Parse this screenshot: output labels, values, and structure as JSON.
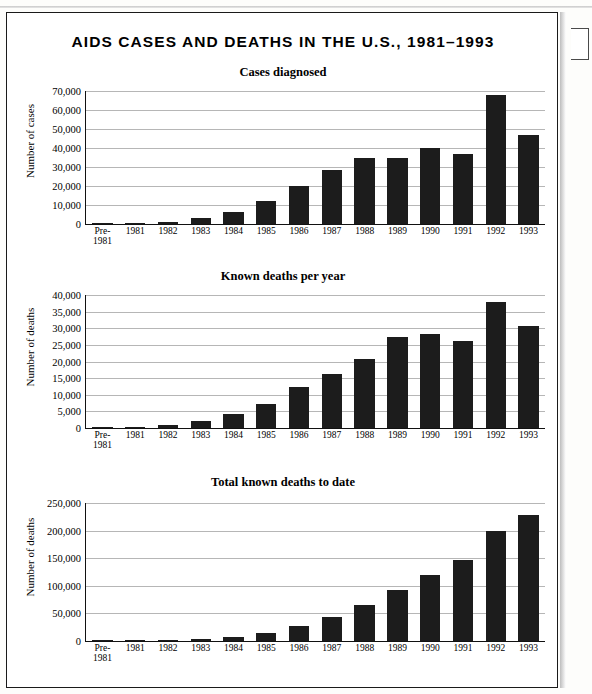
{
  "figure": {
    "main_title": "AIDS CASES AND DEATHS IN THE U.S., 1981–1993"
  },
  "chart_data": [
    {
      "type": "bar",
      "title": "Cases diagnosed",
      "xlabel": "",
      "ylabel": "Number of cases",
      "ylim": [
        0,
        70000
      ],
      "ytick_labels": [
        "0",
        "10,000",
        "20,000",
        "30,000",
        "40,000",
        "50,000",
        "60,000",
        "70,000"
      ],
      "yticks": [
        0,
        10000,
        20000,
        30000,
        40000,
        50000,
        60000,
        70000
      ],
      "grid": true,
      "legend": "none",
      "categories": [
        "Pre-\n1981",
        "1981",
        "1982",
        "1983",
        "1984",
        "1985",
        "1986",
        "1987",
        "1988",
        "1989",
        "1990",
        "1991",
        "1992",
        "1993"
      ],
      "values": [
        100,
        350,
        1300,
        3200,
        6400,
        12000,
        20000,
        28500,
        35000,
        34500,
        40000,
        37000,
        68000,
        47000
      ]
    },
    {
      "type": "bar",
      "title": "Known deaths per year",
      "xlabel": "",
      "ylabel": "Number of deaths",
      "ylim": [
        0,
        40000
      ],
      "ytick_labels": [
        "0",
        "5,000",
        "10,000",
        "15,000",
        "20,000",
        "25,000",
        "30,000",
        "35,000",
        "40,000"
      ],
      "yticks": [
        0,
        5000,
        10000,
        15000,
        20000,
        25000,
        30000,
        35000,
        40000
      ],
      "grid": true,
      "legend": "none",
      "categories": [
        "Pre-\n1981",
        "1981",
        "1982",
        "1983",
        "1984",
        "1985",
        "1986",
        "1987",
        "1988",
        "1989",
        "1990",
        "1991",
        "1992",
        "1993"
      ],
      "values": [
        60,
        250,
        900,
        2200,
        4300,
        7300,
        12200,
        16300,
        20800,
        27300,
        28200,
        26300,
        38000,
        30800
      ]
    },
    {
      "type": "bar",
      "title": "Total known deaths to date",
      "xlabel": "",
      "ylabel": "Number of deaths",
      "ylim": [
        0,
        250000
      ],
      "ytick_labels": [
        "0",
        "50,000",
        "100,000",
        "150,000",
        "200,000",
        "250,000"
      ],
      "yticks": [
        0,
        50000,
        100000,
        150000,
        200000,
        250000
      ],
      "grid": true,
      "legend": "none",
      "categories": [
        "Pre-\n1981",
        "1981",
        "1982",
        "1983",
        "1984",
        "1985",
        "1986",
        "1987",
        "1988",
        "1989",
        "1990",
        "1991",
        "1992",
        "1993"
      ],
      "values": [
        100,
        400,
        1500,
        3700,
        8000,
        15300,
        27500,
        43800,
        64600,
        91900,
        120100,
        146400,
        199000,
        228000
      ]
    }
  ]
}
